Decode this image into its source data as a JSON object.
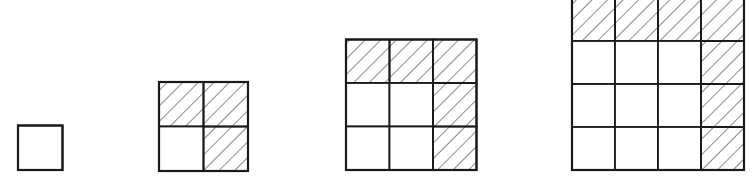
{
  "diagram": {
    "title": "",
    "colors": {
      "stroke": "#1a1a1a",
      "hatch": "#2a2a2a",
      "background": "#ffffff"
    },
    "figures": [
      {
        "n": 1,
        "shaded": []
      },
      {
        "n": 2,
        "shaded": [
          [
            0,
            0
          ],
          [
            0,
            1
          ],
          [
            1,
            1
          ]
        ]
      },
      {
        "n": 3,
        "shaded": [
          [
            0,
            0
          ],
          [
            0,
            1
          ],
          [
            0,
            2
          ],
          [
            1,
            2
          ],
          [
            2,
            2
          ]
        ]
      },
      {
        "n": 4,
        "shaded": [
          [
            0,
            0
          ],
          [
            0,
            1
          ],
          [
            0,
            2
          ],
          [
            0,
            3
          ],
          [
            1,
            3
          ],
          [
            2,
            3
          ],
          [
            3,
            3
          ]
        ]
      }
    ]
  }
}
